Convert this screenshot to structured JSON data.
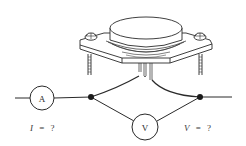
{
  "diagram": {
    "components": {
      "transistor": {
        "type": "TO-3 power transistor package"
      },
      "ammeter": {
        "symbol": "A"
      },
      "voltmeter": {
        "symbol": "V"
      }
    },
    "labels": {
      "current": {
        "variable": "I",
        "equals": "=",
        "value": "?"
      },
      "voltage": {
        "variable": "V",
        "equals": "=",
        "value": "?"
      }
    },
    "colors": {
      "line": "#2a2a2a",
      "background": "#ffffff"
    }
  }
}
